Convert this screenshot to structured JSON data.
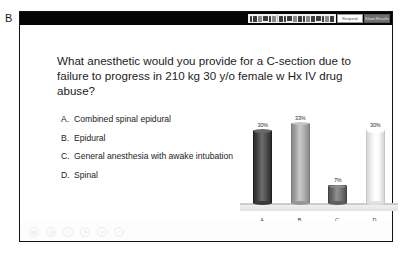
{
  "figure": {
    "panel_label": "B"
  },
  "toolbar": {
    "icons": [
      "cursor-icon",
      "pen-icon",
      "highlighter-icon",
      "eraser-icon",
      "shapes-icon",
      "text-icon",
      "image-icon",
      "chart-icon",
      "table-icon",
      "link-icon",
      "bold-icon",
      "italic-icon",
      "underline-icon",
      "align-icon",
      "list-icon",
      "color-icon",
      "zoom-icon",
      "settings-icon"
    ],
    "buttons": [
      {
        "label": "Respond",
        "style": "light"
      },
      {
        "label": "Show Results",
        "style": "dark"
      }
    ]
  },
  "slide": {
    "question": "What anesthetic would you provide for a C-section due to failure to progress in 210 kg 30 y/o female w Hx IV drug abuse?",
    "options": [
      {
        "key": "A.",
        "text": "Combined spinal epidural"
      },
      {
        "key": "B.",
        "text": "Epidural"
      },
      {
        "key": "C.",
        "text": "General anesthesia with awake intubation"
      },
      {
        "key": "D.",
        "text": "Spinal"
      }
    ]
  },
  "chart_data": {
    "type": "bar",
    "title": "",
    "xlabel": "",
    "ylabel": "",
    "categories": [
      "A.",
      "B.",
      "C.",
      "D."
    ],
    "values": [
      30,
      33,
      7,
      30
    ],
    "value_labels": [
      "30%",
      "33%",
      "7%",
      "30%"
    ],
    "ylim": [
      0,
      35
    ],
    "grid": false,
    "legend": "none",
    "bar_style": "3d-cylinder",
    "bar_colors": [
      "#4a4a4a",
      "#a8a8a8",
      "#6f6f6f",
      "#f2f2f2"
    ]
  },
  "bottombar": {
    "icons": [
      "camera-icon",
      "comment-icon",
      "question-icon",
      "star-icon",
      "list-icon",
      "reply-icon"
    ],
    "glyphs": [
      "▣",
      "◍",
      "2",
      "✻",
      "≡",
      "⤺"
    ]
  }
}
